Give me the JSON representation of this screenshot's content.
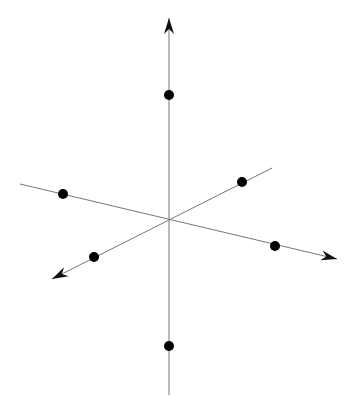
{
  "diagram": {
    "type": "3d-coordinate-axes-with-octahedron-vertices",
    "colors": {
      "background": "#ffffff",
      "axis": "#777777",
      "point": "#000000",
      "arrow": "#111111"
    },
    "origin": [
      169,
      219
    ],
    "axes": [
      {
        "name": "vertical",
        "from": [
          169,
          395
        ],
        "to": [
          169,
          18
        ],
        "arrow_at": "to"
      },
      {
        "name": "horizontal-oblique",
        "from": [
          20,
          184
        ],
        "to": [
          337,
          259
        ],
        "arrow_at": "to"
      },
      {
        "name": "depth-oblique",
        "from": [
          272,
          168
        ],
        "to": [
          52,
          279
        ],
        "arrow_at": "to"
      }
    ],
    "points": [
      {
        "name": "top",
        "xy": [
          169,
          95
        ]
      },
      {
        "name": "bottom",
        "xy": [
          169,
          346
        ]
      },
      {
        "name": "left-upper",
        "xy": [
          63,
          194
        ]
      },
      {
        "name": "right-lower",
        "xy": [
          275,
          246
        ]
      },
      {
        "name": "right-upper",
        "xy": [
          242,
          182
        ]
      },
      {
        "name": "left-lower",
        "xy": [
          94,
          257
        ]
      }
    ],
    "point_radius": 5
  }
}
